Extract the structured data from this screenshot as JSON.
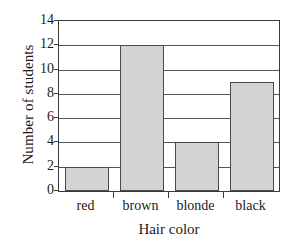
{
  "chart_data": {
    "type": "bar",
    "title": "",
    "categories": [
      "red",
      "brown",
      "blonde",
      "black"
    ],
    "values": [
      2,
      12,
      4,
      9
    ],
    "xlabel": "Hair color",
    "ylabel": "Number of students",
    "ylim": [
      0,
      14
    ],
    "ytick_values": [
      0,
      2,
      4,
      6,
      8,
      10,
      12,
      14
    ],
    "ytick_labels": [
      "0",
      "2",
      "4",
      "6",
      "8",
      "10",
      "12",
      "14"
    ],
    "grid": "horizontal",
    "legend": "none",
    "bar_fill_color": "#d3d3d3",
    "bar_edge_color": "#4a4a4a",
    "axis_color": "#3a3a3a",
    "background_color": "#ffffff"
  }
}
